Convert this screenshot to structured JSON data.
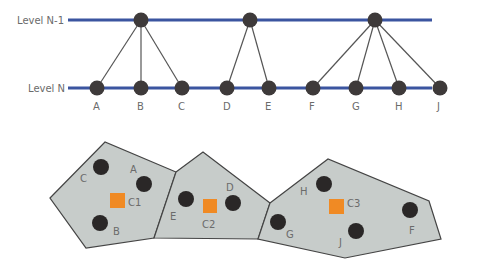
{
  "colors": {
    "level_line": "#3b55a0",
    "node": "#3e3a3a",
    "edge": "#555555",
    "cell_fill": "#c7ccca",
    "cell_stroke": "#444444",
    "centroid": "#f08a24",
    "label": "#6b6b6b"
  },
  "hierarchy": {
    "levels": [
      {
        "label": "Level N-1",
        "y": 20
      },
      {
        "label": "Level N",
        "y": 88
      }
    ],
    "parents": [
      {
        "id": "P1",
        "x": 141,
        "y": 20,
        "children": [
          "A",
          "B",
          "C"
        ]
      },
      {
        "id": "P2",
        "x": 250,
        "y": 20,
        "children": [
          "D",
          "E"
        ]
      },
      {
        "id": "P3",
        "x": 375,
        "y": 20,
        "children": [
          "F",
          "G",
          "H",
          "J"
        ]
      }
    ],
    "nodes": [
      {
        "id": "A",
        "x": 97,
        "y": 88
      },
      {
        "id": "B",
        "x": 141,
        "y": 88
      },
      {
        "id": "C",
        "x": 182,
        "y": 88
      },
      {
        "id": "D",
        "x": 227,
        "y": 88
      },
      {
        "id": "E",
        "x": 269,
        "y": 88
      },
      {
        "id": "F",
        "x": 313,
        "y": 88
      },
      {
        "id": "G",
        "x": 356,
        "y": 88
      },
      {
        "id": "H",
        "x": 399,
        "y": 88
      },
      {
        "id": "J",
        "x": 440,
        "y": 88
      }
    ]
  },
  "clusters": [
    {
      "centroid": "C1",
      "polygon": "50,198 105,142 176,172 154,238 86,248",
      "centroid_pos": [
        117,
        201
      ],
      "points": [
        {
          "id": "C",
          "x": 101,
          "y": 167,
          "lx": 82,
          "ly": 181
        },
        {
          "id": "A",
          "x": 144,
          "y": 184,
          "lx": 131,
          "ly": 172
        },
        {
          "id": "B",
          "x": 100,
          "y": 223,
          "lx": 115,
          "ly": 235
        }
      ]
    },
    {
      "centroid": "C2",
      "polygon": "176,172 203,152 270,203 258,239 154,238",
      "centroid_pos": [
        210,
        206
      ],
      "points": [
        {
          "id": "E",
          "x": 186,
          "y": 199,
          "lx": 171,
          "ly": 220
        },
        {
          "id": "D",
          "x": 233,
          "y": 203,
          "lx": 227,
          "ly": 191
        },
        {
          "id": "C2",
          "x": 0,
          "y": 0,
          "lx": 203,
          "ly": 229
        }
      ]
    },
    {
      "centroid": "C3",
      "polygon": "270,203 328,159 429,201 441,239 345,258 258,239",
      "centroid_pos": [
        337,
        207
      ],
      "points": [
        {
          "id": "H",
          "x": 324,
          "y": 184,
          "lx": 300,
          "ly": 195
        },
        {
          "id": "G",
          "x": 278,
          "y": 222,
          "lx": 287,
          "ly": 238
        },
        {
          "id": "J",
          "x": 356,
          "y": 231,
          "lx": 341,
          "ly": 246
        },
        {
          "id": "F",
          "x": 410,
          "y": 210,
          "lx": 410,
          "ly": 234
        }
      ]
    }
  ],
  "labels": {
    "level_n1": "Level N-1",
    "level_n": "Level N",
    "c1": "C1",
    "c2": "C2",
    "c3": "C3",
    "A": "A",
    "B": "B",
    "C": "C",
    "D": "D",
    "E": "E",
    "F": "F",
    "G": "G",
    "H": "H",
    "J": "J"
  }
}
